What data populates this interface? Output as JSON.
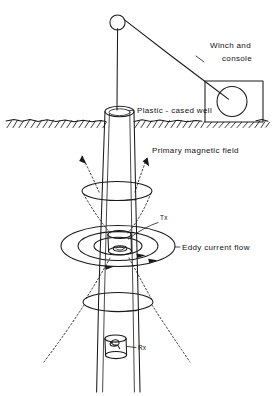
{
  "figure": {
    "background_color": "#ffffff",
    "ink_color": "#1a1a1a",
    "width": 272,
    "height": 396
  },
  "labels": {
    "winch_line1": "Winch and",
    "winch_line2": "console",
    "well": "Plastic - cased well",
    "primary_field": "Primary magnetic field",
    "eddy_current": "Eddy current flow",
    "transmitter": "Tx",
    "receiver": "Rx"
  },
  "components": {
    "pulley": "pulley-wheel",
    "cable": "logging-cable",
    "mast": "derrick-mast",
    "winch_box": "winch-console-box",
    "winch_drum": "winch-drum",
    "ground": "ground-surface-hatching",
    "casing": "plastic-well-casing",
    "tx_coil": "transmitter-coil",
    "rx_coil": "receiver-coil",
    "field_loops": "primary-magnetic-field-loops",
    "eddy_loops": "eddy-current-loops"
  },
  "annotations": {
    "field_loop_count": 2,
    "eddy_ring_count": 3,
    "leader_lines": 5
  }
}
